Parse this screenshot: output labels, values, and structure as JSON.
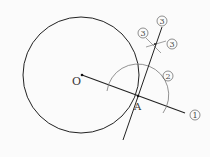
{
  "diagram": {
    "points": {
      "O": {
        "label": "O",
        "x": 82,
        "y": 75
      },
      "A": {
        "label": "A",
        "x": 138,
        "y": 96
      }
    },
    "circle": {
      "cx": 81,
      "cy": 75,
      "r": 58
    },
    "step_labels": {
      "ray": "1",
      "arc": "2",
      "cross_left": "3",
      "cross_right": "3",
      "tangent": "3"
    },
    "colors": {
      "line": "#222222",
      "construction": "#777777",
      "background": "#fbfbfb"
    }
  }
}
